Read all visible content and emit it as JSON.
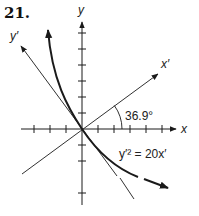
{
  "problem_number": "21.",
  "axes": {
    "x_label": "x",
    "y_label": "y",
    "x_prime_label": "x′",
    "y_prime_label": "y′"
  },
  "rotation_angle_label": "36.9°",
  "equation_label": "y′² = 20x′",
  "colors": {
    "ink": "#1a1a1a",
    "background": "#ffffff"
  }
}
